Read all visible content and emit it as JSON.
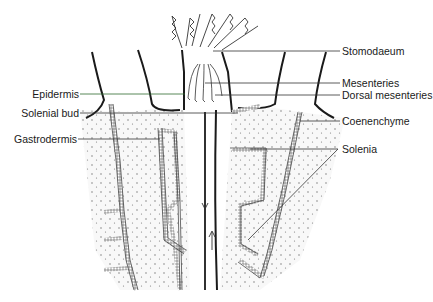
{
  "diagram": {
    "colors": {
      "ink": "#1a1a1a",
      "leader": "#333333",
      "epidermis_leader": "#2e6b2e",
      "stipple": "#e9e9e9"
    }
  },
  "labels": {
    "stomodaeum": "Stomodaeum",
    "mesenteries": "Mesenteries",
    "dorsal_mesenteries": "Dorsal mesenteries",
    "coenenchyme": "Coenenchyme",
    "solenia": "Solenia",
    "epidermis": "Epidermis",
    "solenial_bud": "Solenial bud",
    "gastrodermis": "Gastrodermis"
  }
}
